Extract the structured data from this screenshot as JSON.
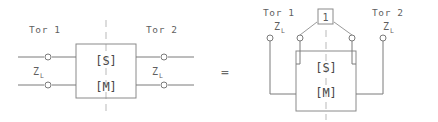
{
  "figure": {
    "equals_sign": "=",
    "left_circuit": {
      "port1_label": "Tor 1",
      "port2_label": "Tor 2",
      "impedance_left": "Z",
      "impedance_left_sub": "L",
      "impedance_right": "Z",
      "impedance_right_sub": "L",
      "block_scattering": "[S]",
      "block_impedance": "[M]"
    },
    "right_circuit": {
      "port1_label": "Tor 1",
      "port2_label": "Tor 2",
      "impedance_left": "Z",
      "impedance_left_sub": "L",
      "impedance_right": "Z",
      "impedance_right_sub": "L",
      "reference_box_label": "1",
      "block_scattering": "[S]",
      "block_impedance": "[M]"
    }
  },
  "colors": {
    "wire": "#7a7a7a",
    "box": "#8a8a8a",
    "centerline": "#b9b9b9",
    "text": "#5f5f5f",
    "background": "#ffffff"
  }
}
